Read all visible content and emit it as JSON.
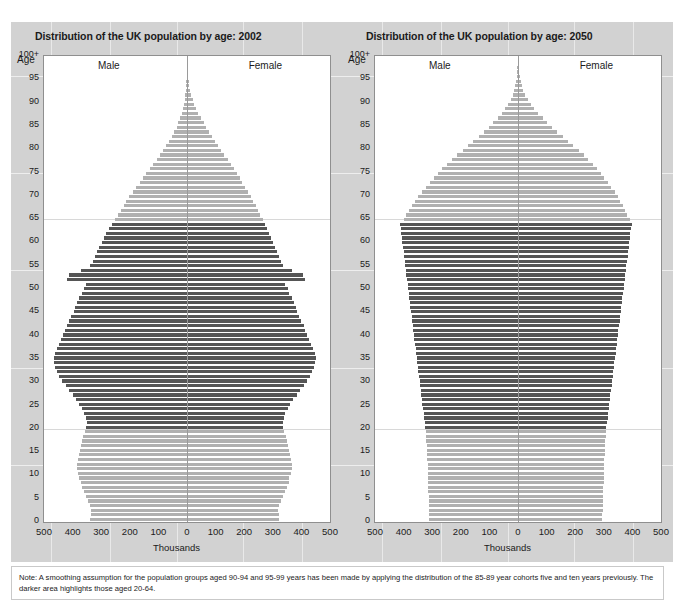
{
  "page": {
    "note": "Note: A smoothing assumption for the population groups aged 90-94 and 95-99 years has been made by applying the distribution of the 85-89 year cohorts five and ten years previously. The darker area highlights those aged 20-64."
  },
  "colors": {
    "panel_background": "#d2d2d2",
    "plot_background": "#ffffff",
    "bar_light": "#b0b0b0",
    "bar_dark": "#555555",
    "axis": "#9a9a9a",
    "text": "#1b1b1b"
  },
  "charts": [
    {
      "id": "chart-2002",
      "title": "Distribution of the UK population by age: 2002",
      "axis_title_y": "Age",
      "axis_title_x": "Thousands",
      "label_male": "Male",
      "label_female": "Female"
    },
    {
      "id": "chart-2050",
      "title": "Distribution of the UK population by age: 2050",
      "axis_title_y": "Age",
      "axis_title_x": "Thousands",
      "label_male": "Male",
      "label_female": "Female"
    }
  ],
  "chart_data": [
    {
      "type": "bar",
      "orientation": "horizontal",
      "subtype": "population-pyramid",
      "title": "Distribution of the UK population by age: 2002",
      "xlabel": "Thousands",
      "ylabel": "Age",
      "xlim": [
        -500,
        500
      ],
      "xticks": [
        500,
        400,
        300,
        200,
        100,
        0,
        100,
        200,
        300,
        400,
        500
      ],
      "yticks": [
        "0",
        "5",
        "10",
        "15",
        "20",
        "25",
        "30",
        "35",
        "40",
        "45",
        "50",
        "55",
        "60",
        "65",
        "70",
        "75",
        "80",
        "85",
        "90",
        "95",
        "100+"
      ],
      "ylim": [
        0,
        100
      ],
      "grid": false,
      "legend": [
        "Male",
        "Female"
      ],
      "legend_position": "inside-top",
      "highlight_range": [
        20,
        64
      ],
      "highlight_note": "darker bars = ages 20-64",
      "ages": [
        0,
        1,
        2,
        3,
        4,
        5,
        6,
        7,
        8,
        9,
        10,
        11,
        12,
        13,
        14,
        15,
        16,
        17,
        18,
        19,
        20,
        21,
        22,
        23,
        24,
        25,
        26,
        27,
        28,
        29,
        30,
        31,
        32,
        33,
        34,
        35,
        36,
        37,
        38,
        39,
        40,
        41,
        42,
        43,
        44,
        45,
        46,
        47,
        48,
        49,
        50,
        51,
        52,
        53,
        54,
        55,
        56,
        57,
        58,
        59,
        60,
        61,
        62,
        63,
        64,
        65,
        66,
        67,
        68,
        69,
        70,
        71,
        72,
        73,
        74,
        75,
        76,
        77,
        78,
        79,
        80,
        81,
        82,
        83,
        84,
        85,
        86,
        87,
        88,
        89,
        90,
        91,
        92,
        93,
        94,
        95,
        96,
        97,
        98,
        99,
        100
      ],
      "series": [
        {
          "name": "Male",
          "values": [
            340,
            336,
            334,
            338,
            345,
            352,
            360,
            368,
            372,
            376,
            380,
            384,
            386,
            382,
            378,
            374,
            372,
            368,
            364,
            358,
            352,
            350,
            354,
            360,
            368,
            376,
            388,
            400,
            412,
            424,
            436,
            446,
            454,
            460,
            464,
            466,
            462,
            456,
            448,
            440,
            434,
            428,
            420,
            412,
            404,
            396,
            390,
            384,
            376,
            368,
            360,
            352,
            420,
            412,
            372,
            340,
            330,
            322,
            314,
            306,
            298,
            290,
            282,
            272,
            262,
            252,
            242,
            232,
            222,
            212,
            202,
            190,
            178,
            166,
            154,
            142,
            130,
            118,
            106,
            94,
            84,
            72,
            62,
            52,
            44,
            36,
            30,
            24,
            19,
            15,
            11,
            8,
            6,
            4,
            3,
            2,
            1.5,
            1,
            0.7,
            0.4,
            0.3
          ]
        },
        {
          "name": "Female",
          "values": [
            323,
            320,
            318,
            322,
            329,
            336,
            343,
            350,
            355,
            358,
            362,
            366,
            368,
            364,
            360,
            356,
            354,
            350,
            346,
            340,
            336,
            334,
            338,
            344,
            352,
            360,
            372,
            384,
            396,
            408,
            420,
            430,
            438,
            444,
            448,
            450,
            446,
            440,
            434,
            426,
            420,
            414,
            408,
            400,
            392,
            386,
            380,
            374,
            366,
            358,
            352,
            344,
            412,
            404,
            366,
            336,
            328,
            320,
            314,
            306,
            300,
            294,
            288,
            280,
            272,
            264,
            256,
            248,
            240,
            232,
            224,
            214,
            204,
            194,
            184,
            174,
            164,
            154,
            142,
            130,
            120,
            108,
            98,
            86,
            76,
            66,
            58,
            48,
            40,
            32,
            26,
            20,
            15,
            11,
            8,
            6,
            4.5,
            3,
            2,
            1.2,
            1
          ]
        }
      ]
    },
    {
      "type": "bar",
      "orientation": "horizontal",
      "subtype": "population-pyramid",
      "title": "Distribution of the UK population by age: 2050",
      "xlabel": "Thousands",
      "ylabel": "Age",
      "xlim": [
        -500,
        500
      ],
      "xticks": [
        500,
        400,
        300,
        200,
        100,
        0,
        100,
        200,
        300,
        400,
        500
      ],
      "yticks": [
        "0",
        "5",
        "10",
        "15",
        "20",
        "25",
        "30",
        "35",
        "40",
        "45",
        "50",
        "55",
        "60",
        "65",
        "70",
        "75",
        "80",
        "85",
        "90",
        "95",
        "100+"
      ],
      "ylim": [
        0,
        100
      ],
      "grid": false,
      "legend": [
        "Male",
        "Female"
      ],
      "legend_position": "inside-top",
      "highlight_range": [
        20,
        64
      ],
      "highlight_note": "darker bars = ages 20-64",
      "ages": [
        0,
        1,
        2,
        3,
        4,
        5,
        6,
        7,
        8,
        9,
        10,
        11,
        12,
        13,
        14,
        15,
        16,
        17,
        18,
        19,
        20,
        21,
        22,
        23,
        24,
        25,
        26,
        27,
        28,
        29,
        30,
        31,
        32,
        33,
        34,
        35,
        36,
        37,
        38,
        39,
        40,
        41,
        42,
        43,
        44,
        45,
        46,
        47,
        48,
        49,
        50,
        51,
        52,
        53,
        54,
        55,
        56,
        57,
        58,
        59,
        60,
        61,
        62,
        63,
        64,
        65,
        66,
        67,
        68,
        69,
        70,
        71,
        72,
        73,
        74,
        75,
        76,
        77,
        78,
        79,
        80,
        81,
        82,
        83,
        84,
        85,
        86,
        87,
        88,
        89,
        90,
        91,
        92,
        93,
        94,
        95,
        96,
        97,
        98,
        99,
        100
      ],
      "series": [
        {
          "name": "Male",
          "values": [
            310,
            310,
            311,
            311,
            312,
            312,
            313,
            313,
            314,
            314,
            315,
            316,
            316,
            317,
            318,
            318,
            319,
            320,
            321,
            322,
            324,
            326,
            328,
            330,
            332,
            334,
            336,
            338,
            340,
            342,
            344,
            346,
            348,
            350,
            352,
            354,
            356,
            358,
            360,
            362,
            364,
            366,
            368,
            370,
            372,
            374,
            376,
            378,
            380,
            382,
            384,
            386,
            388,
            390,
            392,
            394,
            396,
            398,
            400,
            402,
            404,
            406,
            408,
            410,
            412,
            400,
            390,
            380,
            370,
            360,
            348,
            336,
            322,
            308,
            294,
            280,
            264,
            248,
            230,
            212,
            194,
            176,
            158,
            138,
            120,
            102,
            86,
            70,
            56,
            44,
            34,
            26,
            19,
            14,
            10,
            7,
            5,
            3,
            2,
            1.2,
            0.8
          ]
        },
        {
          "name": "Female",
          "values": [
            295,
            295,
            296,
            296,
            297,
            297,
            298,
            298,
            299,
            299,
            300,
            301,
            301,
            302,
            303,
            303,
            304,
            305,
            306,
            307,
            309,
            311,
            313,
            315,
            317,
            319,
            321,
            323,
            325,
            327,
            329,
            331,
            333,
            335,
            337,
            339,
            341,
            343,
            345,
            347,
            349,
            351,
            353,
            355,
            357,
            359,
            361,
            363,
            365,
            367,
            369,
            371,
            373,
            375,
            377,
            379,
            381,
            383,
            385,
            387,
            389,
            391,
            393,
            395,
            397,
            390,
            382,
            374,
            366,
            358,
            348,
            338,
            326,
            314,
            302,
            290,
            276,
            262,
            246,
            230,
            212,
            194,
            176,
            156,
            138,
            120,
            102,
            86,
            70,
            56,
            44,
            34,
            25,
            18,
            13,
            9,
            6,
            4,
            2.5,
            1.5,
            1
          ]
        }
      ]
    }
  ]
}
